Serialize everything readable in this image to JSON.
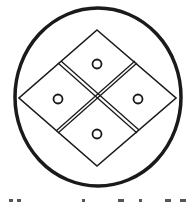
{
  "figure": {
    "stroke_color": "#1a1a1a",
    "background": "#ffffff",
    "outer_circle": {
      "cx": 98,
      "cy": 97,
      "rx": 83,
      "ry": 89
    },
    "diamonds": [
      {
        "name": "top",
        "dot": [
          97,
          64
        ]
      },
      {
        "name": "left",
        "dot": [
          58,
          99
        ]
      },
      {
        "name": "right",
        "dot": [
          138,
          99
        ]
      },
      {
        "name": "bottom",
        "dot": [
          97,
          134
        ]
      }
    ]
  }
}
